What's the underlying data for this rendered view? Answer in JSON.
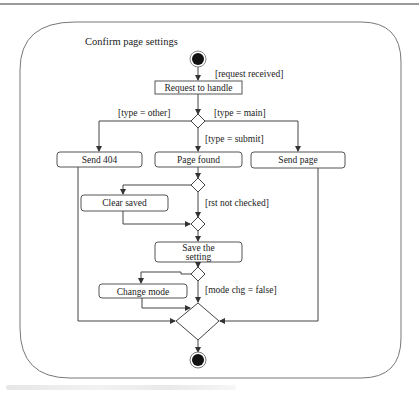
{
  "diagram": {
    "type": "uml-activity-diagram",
    "title": "Confirm page settings",
    "nodes": {
      "start": {
        "kind": "initial"
      },
      "request_to_handle": {
        "label": "Request to handle"
      },
      "send_404": {
        "label": "Send 404"
      },
      "page_found": {
        "label": "Page found"
      },
      "send_page": {
        "label": "Send page"
      },
      "clear_saved": {
        "label": "Clear saved"
      },
      "save_setting_line1": {
        "label": "Save the"
      },
      "save_setting_line2": {
        "label": "setting"
      },
      "change_mode": {
        "label": "Change mode"
      },
      "end": {
        "kind": "final"
      }
    },
    "guards": {
      "request_received": "[request received]",
      "type_other": "[type = other]",
      "type_main": "[type = main]",
      "type_submit": "[type = submit]",
      "rst_not_checked": "[rst not checked]",
      "mode_chg_false": "[mode chg = false]"
    },
    "colors": {
      "stroke": "#444444",
      "fill": "#ffffff",
      "initial_final": "#111111"
    }
  }
}
